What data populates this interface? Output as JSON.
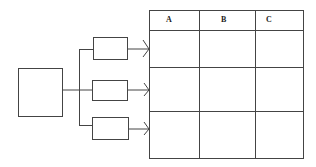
{
  "diagram": {
    "source_block": {
      "label": ""
    },
    "branch_blocks": [
      {
        "label": ""
      },
      {
        "label": ""
      },
      {
        "label": ""
      }
    ],
    "table": {
      "columns": [
        "A",
        "B",
        "C"
      ],
      "rows": [
        [
          "",
          "",
          ""
        ],
        [
          "",
          "",
          ""
        ],
        [
          "",
          "",
          ""
        ]
      ]
    },
    "line_color": "#444444"
  }
}
